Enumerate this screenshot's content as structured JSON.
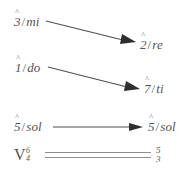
{
  "diagram": {
    "caret_glyph": "^",
    "slash": "/",
    "rows": [
      {
        "id": "row-mi-re",
        "from": {
          "degree": "3",
          "solfege": "mi"
        },
        "to": {
          "degree": "2",
          "solfege": "re"
        },
        "arrow": "diagonal-down"
      },
      {
        "id": "row-do-ti",
        "from": {
          "degree": "1",
          "solfege": "do"
        },
        "to": {
          "degree": "7",
          "solfege": "ti"
        },
        "arrow": "diagonal-down"
      },
      {
        "id": "row-sol-sol",
        "from": {
          "degree": "5",
          "solfege": "sol"
        },
        "to": {
          "degree": "5",
          "solfege": "sol"
        },
        "arrow": "horizontal"
      }
    ],
    "bass": {
      "roman_numeral": "V",
      "figures_left": [
        "6",
        "4"
      ],
      "figures_right": [
        "5",
        "3"
      ],
      "connector": "double-line"
    },
    "colors": {
      "background": "#ffffff",
      "ink": "#545454",
      "arrow": "#2e2e2e",
      "rule": "#8d8d8d"
    }
  }
}
